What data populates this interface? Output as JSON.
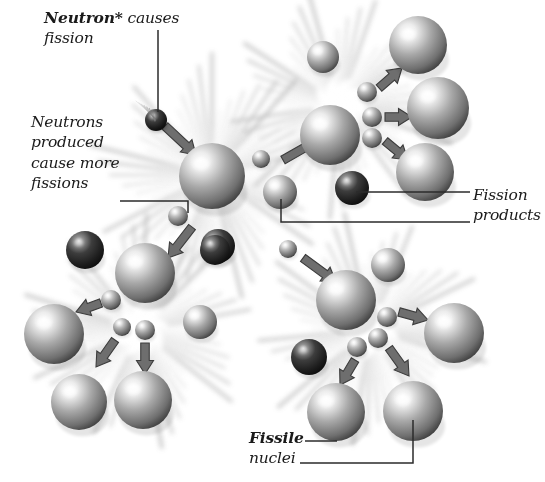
{
  "figure": {
    "background_color": "#ffffff",
    "width": 545,
    "height": 482
  },
  "palette": {
    "sphere_light": "#f2f2f2",
    "sphere_mid": "#8e8e8e",
    "sphere_dark_edge": "#3d3d3d",
    "dark_sphere_mid": "#3a3a3a",
    "dark_sphere_edge": "#121212",
    "arrow_fill": "#6e6e6e",
    "arrow_stroke": "#3c3c3c",
    "burst_color": "#9a9a9a",
    "leader_line": "#2b2b2b",
    "text_color": "#1a1a1a"
  },
  "labels": {
    "neutron_causes": {
      "bold_text": "Neutron*",
      "rest_line1": " causes",
      "line2": "fission",
      "full_text": "Neutron* causes fission"
    },
    "neutrons_produced": {
      "line1": "Neutrons",
      "line2": "produced",
      "line3": "cause more",
      "line4": "fissions",
      "full_text": "Neutrons produced cause more fissions"
    },
    "fission_products": {
      "line1": "Fission",
      "line2": "products",
      "full_text": "Fission products"
    },
    "fissile_nuclei": {
      "bold_text": "Fissile",
      "line2": "nuclei",
      "full_text": "Fissile nuclei"
    }
  },
  "diagram_elements": {
    "incoming_neutron_count": 1,
    "fission_events": 4,
    "event_names": [
      "central-fission-burst",
      "top-right-fission-burst",
      "bottom-left-fission-burst",
      "bottom-right-fission-burst"
    ],
    "leader_lines": 6
  },
  "chart_data": {
    "type": "diagram",
    "bursts": [
      {
        "name": "central",
        "cx": 212,
        "cy": 175,
        "r": 118
      },
      {
        "name": "top-right",
        "cx": 340,
        "cy": 105,
        "r": 110
      },
      {
        "name": "bottom-left",
        "cx": 140,
        "cy": 330,
        "r": 112
      },
      {
        "name": "bottom-right",
        "cx": 370,
        "cy": 330,
        "r": 112
      }
    ],
    "nuclei": [
      {
        "id": "n-central",
        "cx": 212,
        "cy": 176,
        "r": 33,
        "shade": "light"
      },
      {
        "id": "n-tr-core",
        "cx": 330,
        "cy": 135,
        "r": 30,
        "shade": "light"
      },
      {
        "id": "n-tr-a",
        "cx": 418,
        "cy": 45,
        "r": 29,
        "shade": "light"
      },
      {
        "id": "n-tr-b",
        "cx": 438,
        "cy": 108,
        "r": 31,
        "shade": "light"
      },
      {
        "id": "n-tr-c",
        "cx": 425,
        "cy": 172,
        "r": 29,
        "shade": "light"
      },
      {
        "id": "n-bl-core",
        "cx": 145,
        "cy": 273,
        "r": 30,
        "shade": "light"
      },
      {
        "id": "n-bl-a",
        "cx": 54,
        "cy": 334,
        "r": 30,
        "shade": "light"
      },
      {
        "id": "n-bl-b",
        "cx": 79,
        "cy": 402,
        "r": 28,
        "shade": "light"
      },
      {
        "id": "n-bl-c",
        "cx": 143,
        "cy": 400,
        "r": 29,
        "shade": "light"
      },
      {
        "id": "n-br-core",
        "cx": 346,
        "cy": 300,
        "r": 30,
        "shade": "light"
      },
      {
        "id": "n-br-a",
        "cx": 454,
        "cy": 333,
        "r": 30,
        "shade": "light"
      },
      {
        "id": "n-br-b",
        "cx": 336,
        "cy": 412,
        "r": 29,
        "shade": "light"
      },
      {
        "id": "n-br-c",
        "cx": 413,
        "cy": 411,
        "r": 30,
        "shade": "light"
      },
      {
        "id": "n-mid-right",
        "cx": 280,
        "cy": 192,
        "r": 17,
        "shade": "light"
      },
      {
        "id": "n-bl-right",
        "cx": 200,
        "cy": 322,
        "r": 17,
        "shade": "light"
      },
      {
        "id": "n-br-top",
        "cx": 388,
        "cy": 265,
        "r": 17,
        "shade": "light"
      },
      {
        "id": "n-tr-left",
        "cx": 323,
        "cy": 57,
        "r": 16,
        "shade": "light"
      }
    ],
    "fission_products": [
      {
        "id": "fp-central",
        "cx": 218,
        "cy": 246,
        "r": 17,
        "shade": "dark"
      },
      {
        "id": "fp-tr",
        "cx": 352,
        "cy": 188,
        "r": 17,
        "shade": "dark"
      },
      {
        "id": "fp-bl",
        "cx": 85,
        "cy": 250,
        "r": 19,
        "shade": "dark"
      },
      {
        "id": "fp-bl2",
        "cx": 215,
        "cy": 250,
        "r": 15,
        "shade": "dark"
      },
      {
        "id": "fp-br",
        "cx": 309,
        "cy": 357,
        "r": 18,
        "shade": "dark"
      },
      {
        "id": "fp-incoming",
        "cx": 156,
        "cy": 120,
        "r": 11,
        "shade": "dark"
      }
    ],
    "neutrons": [
      {
        "id": "nu-incoming",
        "cx": 156,
        "cy": 120,
        "r": 10
      },
      {
        "id": "nu-c1",
        "cx": 261,
        "cy": 159,
        "r": 9
      },
      {
        "id": "nu-c2",
        "cx": 178,
        "cy": 216,
        "r": 10
      },
      {
        "id": "nu-c3",
        "cx": 288,
        "cy": 249,
        "r": 9
      },
      {
        "id": "nu-tr1",
        "cx": 367,
        "cy": 92,
        "r": 10
      },
      {
        "id": "nu-tr2",
        "cx": 372,
        "cy": 117,
        "r": 10
      },
      {
        "id": "nu-tr3",
        "cx": 372,
        "cy": 138,
        "r": 10
      },
      {
        "id": "nu-bl1",
        "cx": 111,
        "cy": 300,
        "r": 10
      },
      {
        "id": "nu-bl2",
        "cx": 122,
        "cy": 327,
        "r": 9
      },
      {
        "id": "nu-bl3",
        "cx": 145,
        "cy": 330,
        "r": 10
      },
      {
        "id": "nu-br1",
        "cx": 387,
        "cy": 317,
        "r": 10
      },
      {
        "id": "nu-br2",
        "cx": 378,
        "cy": 338,
        "r": 10
      },
      {
        "id": "nu-br3",
        "cx": 357,
        "cy": 347,
        "r": 10
      }
    ],
    "arrows": [
      {
        "id": "ar-incoming",
        "x1": 165,
        "y1": 126,
        "x2": 196,
        "y2": 155
      },
      {
        "id": "ar-c-up",
        "x1": 283,
        "y1": 160,
        "x2": 318,
        "y2": 140
      },
      {
        "id": "ar-c-down",
        "x1": 192,
        "y1": 227,
        "x2": 168,
        "y2": 258
      },
      {
        "id": "ar-c-dr",
        "x1": 303,
        "y1": 258,
        "x2": 336,
        "y2": 282
      },
      {
        "id": "ar-tr1",
        "x1": 379,
        "y1": 88,
        "x2": 402,
        "y2": 68
      },
      {
        "id": "ar-tr2",
        "x1": 385,
        "y1": 117,
        "x2": 412,
        "y2": 117
      },
      {
        "id": "ar-tr3",
        "x1": 385,
        "y1": 141,
        "x2": 408,
        "y2": 160
      },
      {
        "id": "ar-bl1",
        "x1": 101,
        "y1": 303,
        "x2": 76,
        "y2": 312
      },
      {
        "id": "ar-bl2",
        "x1": 115,
        "y1": 340,
        "x2": 96,
        "y2": 367
      },
      {
        "id": "ar-bl3",
        "x1": 145,
        "y1": 343,
        "x2": 145,
        "y2": 374
      },
      {
        "id": "ar-br1",
        "x1": 399,
        "y1": 312,
        "x2": 428,
        "y2": 320
      },
      {
        "id": "ar-br2",
        "x1": 389,
        "y1": 348,
        "x2": 409,
        "y2": 376
      },
      {
        "id": "ar-br3",
        "x1": 355,
        "y1": 360,
        "x2": 340,
        "y2": 385
      }
    ],
    "leaders": [
      {
        "id": "leader-neutron",
        "points": "158,30 158,112"
      },
      {
        "id": "leader-fissions",
        "points": "120,201 188,201 188,213"
      },
      {
        "id": "leader-fp-1",
        "points": "356,192 470,192"
      },
      {
        "id": "leader-fp-2",
        "points": "281,199 281,222 470,222"
      },
      {
        "id": "leader-fissile-1",
        "points": "305,441 337,441"
      },
      {
        "id": "leader-fissile-2",
        "points": "300,463 413,463 413,420"
      }
    ]
  }
}
